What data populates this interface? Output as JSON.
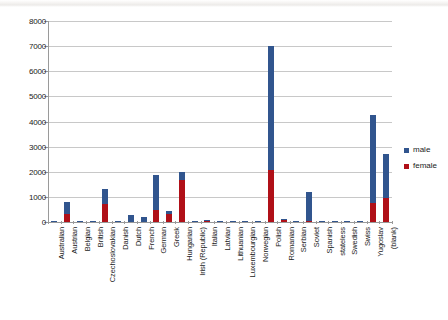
{
  "chart_data": {
    "type": "bar",
    "subtype": "stacked-column",
    "title": "",
    "xlabel": "",
    "ylabel": "",
    "ylim": [
      0,
      8000
    ],
    "ytick_labels": [
      "0",
      "1000",
      "2000",
      "3000",
      "4000",
      "5000",
      "6000",
      "7000",
      "8000"
    ],
    "yticks": [
      0,
      1000,
      2000,
      3000,
      4000,
      5000,
      6000,
      7000,
      8000
    ],
    "grid": true,
    "legend_position": "right",
    "categories": [
      "Australian",
      "Austrian",
      "Belgian",
      "British",
      "Czechoslovakian",
      "Danish",
      "Dutch",
      "French",
      "German",
      "Greek",
      "Hungarian",
      "Irish (Republic)",
      "Italian",
      "Latvian",
      "Lithuanian",
      "Luxembourgian",
      "Norwegian",
      "Polish",
      "Romanian",
      "Serbian",
      "Soviet",
      "Spanish",
      "stateless",
      "Swedish",
      "Swiss",
      "Yugoslav",
      "(blank)"
    ],
    "series": [
      {
        "name": "female",
        "color": "#B01018",
        "values": [
          5,
          330,
          20,
          5,
          700,
          5,
          15,
          20,
          490,
          300,
          1670,
          5,
          35,
          5,
          5,
          5,
          5,
          2060,
          75,
          5,
          55,
          5,
          5,
          5,
          5,
          760,
          960
        ]
      },
      {
        "name": "male",
        "color": "#31558E",
        "values": [
          8,
          480,
          15,
          8,
          600,
          8,
          245,
          160,
          1390,
          125,
          330,
          8,
          20,
          8,
          8,
          8,
          8,
          4940,
          10,
          8,
          1135,
          8,
          8,
          8,
          8,
          3490,
          1740
        ]
      }
    ],
    "totals": [
      13,
      810,
      35,
      13,
      1300,
      13,
      260,
      180,
      1880,
      425,
      2000,
      13,
      55,
      13,
      13,
      13,
      13,
      7000,
      85,
      13,
      1190,
      13,
      13,
      13,
      13,
      4250,
      2700
    ]
  },
  "legend": {
    "entries": [
      {
        "label": "male",
        "color": "#31558E"
      },
      {
        "label": "female",
        "color": "#B01018"
      }
    ]
  }
}
